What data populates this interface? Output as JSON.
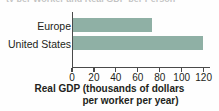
{
  "figure": {
    "clipped_header_fragment": "ty per Worker and Real GDP per Person"
  },
  "chart_data": {
    "type": "bar",
    "orientation": "horizontal",
    "title": "",
    "subtitle": "",
    "categories": [
      "Europe",
      "United States"
    ],
    "values": [
      73,
      119
    ],
    "series": [
      {
        "name": "Real GDP per worker per year",
        "values": [
          73,
          119
        ]
      }
    ],
    "xlabel": "Real GDP (thousands of dollars per worker per year)",
    "xlabel_line1": "Real GDP (thousands of dollars",
    "xlabel_line2": "per worker per year)",
    "ylabel": "",
    "xlim": [
      0,
      124
    ],
    "xticks": [
      0,
      20,
      40,
      60,
      80,
      100,
      120
    ],
    "xtick_labels": [
      "0",
      "20",
      "40",
      "60",
      "80",
      "100",
      "120"
    ],
    "grid": false,
    "legend": false,
    "legend_position": "none",
    "bar_color": "#8fb0a5",
    "axis_color": "#4a4a4a",
    "background_color": "#fefefe"
  }
}
